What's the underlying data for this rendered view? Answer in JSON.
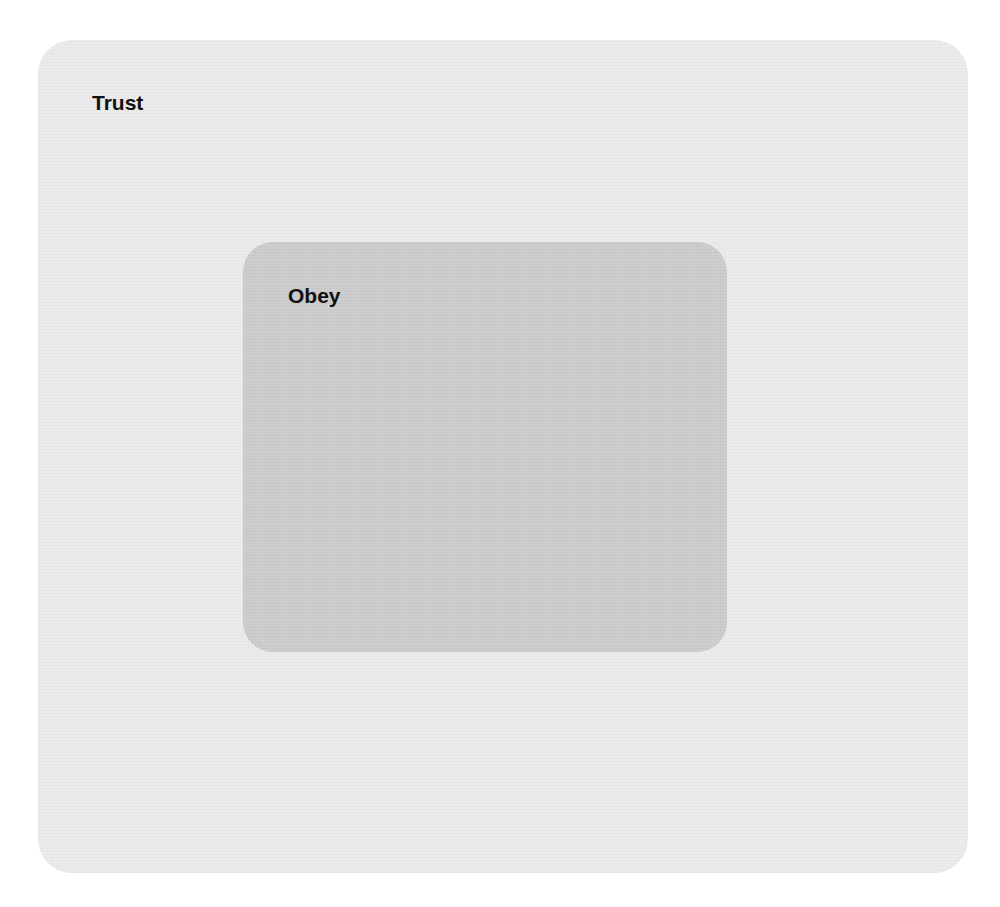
{
  "diagram": {
    "type": "nested-sets",
    "outer": {
      "label": "Trust",
      "fill": "#ececec"
    },
    "inner": {
      "label": "Obey",
      "fill": "#cfcfcf"
    }
  }
}
